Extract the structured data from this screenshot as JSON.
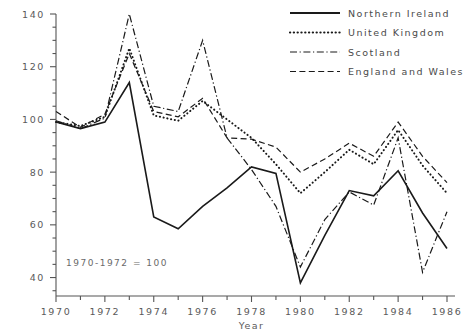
{
  "chart_data": {
    "type": "line",
    "title": "",
    "xlabel": "Year",
    "ylabel": "",
    "annotation": "1970-1972 = 100",
    "grid": false,
    "legend_position": "top-right",
    "xlim": [
      1970,
      1986
    ],
    "ylim": [
      33,
      140
    ],
    "x": [
      1970,
      1971,
      1972,
      1973,
      1974,
      1975,
      1976,
      1977,
      1978,
      1979,
      1980,
      1981,
      1982,
      1983,
      1984,
      1985,
      1986
    ],
    "xticks": [
      1970,
      1972,
      1974,
      1976,
      1978,
      1980,
      1982,
      1984,
      1986
    ],
    "xticklabels": [
      "1970",
      "1972",
      "1974",
      "1976",
      "1978",
      "1980",
      "1982",
      "1984",
      "1986"
    ],
    "yticks": [
      40,
      60,
      80,
      100,
      120,
      140
    ],
    "yticklabels": [
      "40",
      "60",
      "80",
      "100",
      "120",
      "140"
    ],
    "yminorticks": [
      35,
      45,
      50,
      55,
      65,
      70,
      75,
      85,
      90,
      95,
      105,
      110,
      115,
      125,
      130,
      135
    ],
    "series": [
      {
        "name": "Northern Ireland",
        "style": "solid",
        "values": [
          99,
          96.5,
          99,
          114,
          63,
          58.5,
          67,
          74,
          82,
          79.5,
          38,
          56,
          73,
          71,
          80.5,
          64.5,
          51
        ]
      },
      {
        "name": "United Kingdom",
        "style": "dotted",
        "values": [
          99,
          97.5,
          101,
          127,
          101.5,
          99.5,
          107,
          100,
          93,
          83,
          72,
          80,
          88.5,
          83,
          96,
          82.5,
          72
        ]
      },
      {
        "name": "Scotland",
        "style": "dash-dot",
        "values": [
          99.5,
          96.5,
          100.5,
          140,
          105,
          103,
          130,
          93,
          81,
          67,
          44,
          62,
          72.5,
          67.5,
          93,
          42,
          65
        ]
      },
      {
        "name": "England and Wales",
        "style": "dashed",
        "values": [
          103,
          97,
          102,
          125,
          103,
          101,
          108,
          93,
          92.5,
          89.5,
          80,
          85,
          91,
          86,
          99,
          86,
          76
        ]
      }
    ]
  },
  "legend": {
    "items": [
      {
        "label": "Northern Ireland",
        "style": "solid"
      },
      {
        "label": "United Kingdom",
        "style": "dotted"
      },
      {
        "label": "Scotland",
        "style": "dash-dot"
      },
      {
        "label": "England and Wales",
        "style": "dashed"
      }
    ]
  }
}
